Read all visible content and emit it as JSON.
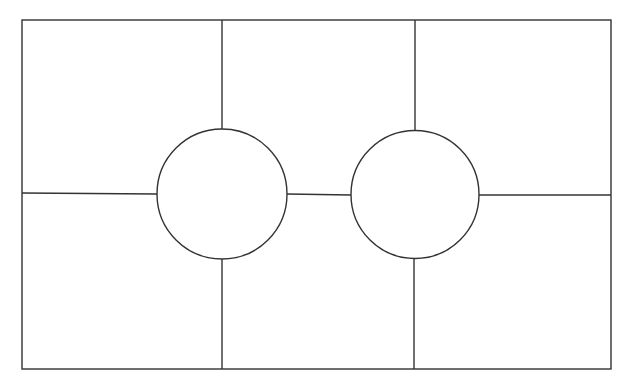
{
  "diagram": {
    "stroke_color": "#333333",
    "background": "#ffffff",
    "outer_rect": {
      "x": 22,
      "y": 20,
      "width": 589,
      "height": 349
    },
    "circles": [
      {
        "id": "left-circle",
        "cx": 222,
        "cy": 194,
        "r": 65
      },
      {
        "id": "right-circle",
        "cx": 415,
        "cy": 194,
        "r": 64
      }
    ],
    "cells": 6,
    "text": []
  }
}
